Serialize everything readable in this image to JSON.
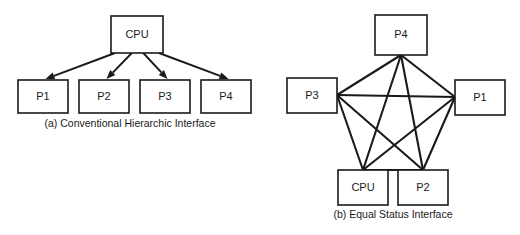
{
  "figure": {
    "background_color": "#ffffff",
    "line_color": "#1a1a1a",
    "panels": [
      {
        "id": "panel-a",
        "caption": "(a) Conventional Hierarchic Interface",
        "topology": "hierarchic-star",
        "directed": true,
        "nodes": [
          {
            "id": "cpu",
            "label": "CPU",
            "x": 111,
            "y": 16,
            "w": 52,
            "h": 37
          },
          {
            "id": "p1",
            "label": "P1",
            "x": 18,
            "y": 80,
            "w": 50,
            "h": 33
          },
          {
            "id": "p2",
            "label": "P2",
            "x": 79,
            "y": 80,
            "w": 50,
            "h": 33
          },
          {
            "id": "p3",
            "label": "P3",
            "x": 140,
            "y": 80,
            "w": 50,
            "h": 33
          },
          {
            "id": "p4",
            "label": "P4",
            "x": 201,
            "y": 80,
            "w": 50,
            "h": 33
          }
        ],
        "edges": [
          {
            "from": "cpu",
            "to": "p1"
          },
          {
            "from": "cpu",
            "to": "p2"
          },
          {
            "from": "cpu",
            "to": "p3"
          },
          {
            "from": "cpu",
            "to": "p4"
          }
        ],
        "caption_x": 130,
        "caption_y": 124
      },
      {
        "id": "panel-b",
        "caption": "(b) Equal Status Interface",
        "topology": "fully-connected-pentagon",
        "directed": false,
        "nodes": [
          {
            "id": "p4b",
            "label": "P4",
            "x": 375,
            "y": 15,
            "w": 52,
            "h": 40,
            "hub_x": 401,
            "hub_y": 55
          },
          {
            "id": "p1b",
            "label": "P1",
            "x": 455,
            "y": 80,
            "w": 50,
            "h": 35,
            "hub_x": 455,
            "hub_y": 97
          },
          {
            "id": "p3b",
            "label": "P3",
            "x": 287,
            "y": 78,
            "w": 50,
            "h": 35,
            "hub_x": 337,
            "hub_y": 95
          },
          {
            "id": "cpub",
            "label": "CPU",
            "x": 338,
            "y": 170,
            "w": 50,
            "h": 35,
            "hub_x": 363,
            "hub_y": 170
          },
          {
            "id": "p2b",
            "label": "P2",
            "x": 398,
            "y": 170,
            "w": 50,
            "h": 35,
            "hub_x": 423,
            "hub_y": 170
          }
        ],
        "edges": [
          {
            "from": "p4b",
            "to": "p1b"
          },
          {
            "from": "p4b",
            "to": "p3b"
          },
          {
            "from": "p4b",
            "to": "cpub"
          },
          {
            "from": "p4b",
            "to": "p2b"
          },
          {
            "from": "p1b",
            "to": "p3b"
          },
          {
            "from": "p1b",
            "to": "cpub"
          },
          {
            "from": "p1b",
            "to": "p2b"
          },
          {
            "from": "p3b",
            "to": "cpub"
          },
          {
            "from": "p3b",
            "to": "p2b"
          },
          {
            "from": "cpub",
            "to": "p2b"
          }
        ],
        "caption_x": 393,
        "caption_y": 215
      }
    ]
  }
}
